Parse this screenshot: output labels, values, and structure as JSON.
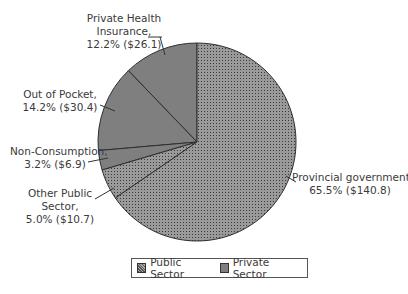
{
  "chart_data": {
    "type": "pie",
    "title": "",
    "start_angle": "12 o'clock, counterclockwise",
    "slices": [
      {
        "label": "Private Health Insurance",
        "percent": 12.2,
        "value": 26.1,
        "group": "Private Sector"
      },
      {
        "label": "Out of Pocket",
        "percent": 14.2,
        "value": 30.4,
        "group": "Private Sector"
      },
      {
        "label": "Non-Consumption",
        "percent": 3.2,
        "value": 6.9,
        "group": "Private Sector"
      },
      {
        "label": "Other Public Sector",
        "percent": 5.0,
        "value": 10.7,
        "group": "Public Sector"
      },
      {
        "label": "Provincial government",
        "percent": 65.5,
        "value": 140.8,
        "group": "Public Sector"
      }
    ],
    "legend": [
      {
        "label": "Public Sector",
        "pattern": "dotted",
        "color": "#8c8c8c"
      },
      {
        "label": "Private Sector",
        "pattern": "solid",
        "color": "#7f7f7f"
      }
    ],
    "legend_position": "bottom"
  },
  "labels": {
    "phi": [
      "Private Health",
      "Insurance,",
      "12.2% ($26.1)"
    ],
    "oop": [
      "Out of Pocket,",
      "14.2% ($30.4)"
    ],
    "nc": [
      "Non-Consumption,",
      "3.2% ($6.9)"
    ],
    "ops": [
      "Other Public",
      "Sector,",
      "5.0% ($10.7)"
    ],
    "pg": [
      "Provincial government",
      "65.5% ($140.8)"
    ]
  },
  "legend": {
    "public": "Public Sector",
    "private": "Private Sector"
  }
}
